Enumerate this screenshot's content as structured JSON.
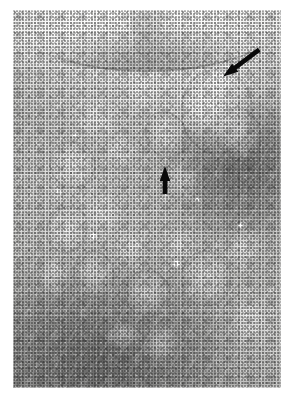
{
  "figure": {
    "kind": "histopathology-micrograph",
    "modality": "light microscopy",
    "staining_appearance": "grayscale halftone print",
    "caption": "",
    "plate": {
      "x": 13,
      "y": 10,
      "width": 268,
      "height": 378,
      "background_color": "#ffffff",
      "tissue_mid_tone": "#bdbdbb",
      "capsule_tone": "#f5f5f4",
      "dense_zone_tone": "#8e8e8c"
    },
    "annotations": [
      {
        "name": "arrow-upper-right",
        "glyph": "arrow",
        "color": "#0a0a0a",
        "label": "",
        "direction": "down-left",
        "angle_deg": 215,
        "tail": {
          "x": 264,
          "y": 56
        },
        "tip": {
          "x": 228,
          "y": 83
        },
        "points_at": "pale rounded nodule at the cortex edge"
      },
      {
        "name": "arrow-center",
        "glyph": "arrow",
        "color": "#0a0a0a",
        "label": "",
        "direction": "up",
        "angle_deg": 90,
        "tail": {
          "x": 157,
          "y": 194
        },
        "tip": {
          "x": 157,
          "y": 166
        },
        "points_at": "interfollicular tissue in the mid field"
      }
    ],
    "regions": [
      {
        "name": "capsule-band",
        "description": "pale fibrous capsule arc across the top of the section"
      },
      {
        "name": "cortex",
        "description": "mottled zone with multiple pale rounded nodules"
      },
      {
        "name": "dense-lymphoid-zone",
        "description": "darker, densely cellular area occupying the lower-left and right margin"
      }
    ],
    "follicles": [
      {
        "cx": 31,
        "cy": 29,
        "rx": 9,
        "ry": 7,
        "rimmed": false
      },
      {
        "cx": 48,
        "cy": 22,
        "rx": 7,
        "ry": 5,
        "rimmed": false
      },
      {
        "cx": 22,
        "cy": 41,
        "rx": 8,
        "ry": 6,
        "rimmed": true
      },
      {
        "cx": 40,
        "cy": 37,
        "rx": 6,
        "ry": 5,
        "rimmed": false
      },
      {
        "cx": 57,
        "cy": 33,
        "rx": 7,
        "ry": 6,
        "rimmed": true
      },
      {
        "cx": 70,
        "cy": 26,
        "rx": 8,
        "ry": 6,
        "rimmed": false
      },
      {
        "cx": 63,
        "cy": 45,
        "rx": 7,
        "ry": 6,
        "rimmed": false
      },
      {
        "cx": 78,
        "cy": 18,
        "rx": 6,
        "ry": 5,
        "rimmed": false
      },
      {
        "cx": 84,
        "cy": 33,
        "rx": 8,
        "ry": 7,
        "rimmed": true
      },
      {
        "cx": 20,
        "cy": 58,
        "rx": 7,
        "ry": 6,
        "rimmed": true
      },
      {
        "cx": 33,
        "cy": 54,
        "rx": 8,
        "ry": 6,
        "rimmed": false
      },
      {
        "cx": 15,
        "cy": 70,
        "rx": 6,
        "ry": 6,
        "rimmed": false
      },
      {
        "cx": 30,
        "cy": 70,
        "rx": 7,
        "ry": 6,
        "rimmed": true
      },
      {
        "cx": 44,
        "cy": 63,
        "rx": 6,
        "ry": 5,
        "rimmed": false
      },
      {
        "cx": 50,
        "cy": 75,
        "rx": 8,
        "ry": 6,
        "rimmed": true
      },
      {
        "cx": 62,
        "cy": 62,
        "rx": 6,
        "ry": 5,
        "rimmed": false
      },
      {
        "cx": 72,
        "cy": 71,
        "rx": 9,
        "ry": 7,
        "rimmed": true
      },
      {
        "cx": 86,
        "cy": 63,
        "rx": 7,
        "ry": 6,
        "rimmed": false
      },
      {
        "cx": 76,
        "cy": 27,
        "rx": 13,
        "ry": 11,
        "rimmed": true
      },
      {
        "cx": 55,
        "cy": 88,
        "rx": 8,
        "ry": 5,
        "rimmed": false
      },
      {
        "cx": 88,
        "cy": 82,
        "rx": 7,
        "ry": 6,
        "rimmed": false
      },
      {
        "cx": 41,
        "cy": 86,
        "rx": 6,
        "ry": 4,
        "rimmed": false
      }
    ],
    "lumens": [
      {
        "cx": 17,
        "cy": 48,
        "r": 2.0
      },
      {
        "cx": 30,
        "cy": 60,
        "r": 2.4
      },
      {
        "cx": 61,
        "cy": 67,
        "r": 2.6
      },
      {
        "cx": 23,
        "cy": 33,
        "r": 1.6
      },
      {
        "cx": 69,
        "cy": 50,
        "r": 1.5
      },
      {
        "cx": 2,
        "cy": 62,
        "r": 1.7
      },
      {
        "cx": 85,
        "cy": 57,
        "r": 1.4
      }
    ]
  }
}
